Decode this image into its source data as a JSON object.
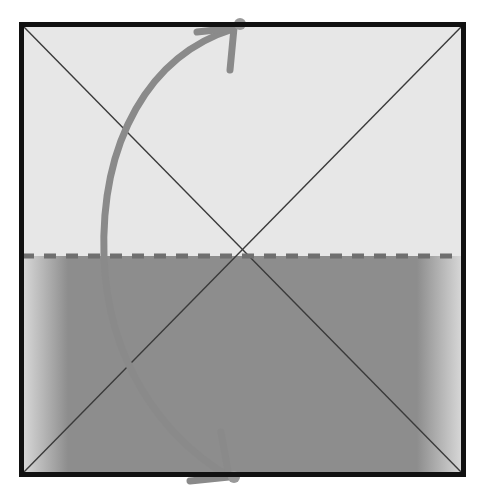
{
  "figure": {
    "title": "",
    "type": "schematic-diagram",
    "canvas": {
      "width": 483,
      "height": 491,
      "background": "#ffffff"
    },
    "frame": {
      "name": "square-frame",
      "x": 19,
      "y": 22,
      "width": 447,
      "height": 455,
      "border_color": "#111111",
      "border_width": 5
    },
    "regions": [
      {
        "name": "upper-light-region",
        "label": "",
        "color": "#e7e7e7",
        "y_top": 22,
        "y_bottom": 256
      },
      {
        "name": "lower-dark-region",
        "label": "",
        "color": "#8d8d8d",
        "y_top": 256,
        "y_bottom": 477,
        "gradient_fade_px": 26
      }
    ],
    "divider": {
      "name": "dashed-interface-line",
      "label": "",
      "y": 256,
      "color": "#6f6f6f",
      "stroke_width": 5,
      "dash": "12 10",
      "x_start": 22,
      "x_end": 464
    },
    "diagonals": [
      {
        "name": "diagonal-tl-br",
        "x1": 22,
        "y1": 25,
        "x2": 463,
        "y2": 474,
        "color": "#3a3a3a",
        "stroke_width": 1.4
      },
      {
        "name": "diagonal-bl-tr",
        "x1": 22,
        "y1": 474,
        "x2": 463,
        "y2": 25,
        "color": "#3a3a3a",
        "stroke_width": 1.4
      }
    ],
    "diagonal_intersection": {
      "x": 242,
      "y": 250
    },
    "arrow": {
      "name": "curved-double-arrow",
      "label": "",
      "color": "#8a8a8a",
      "stroke_width": 7,
      "path": "M 233 29 C 150 55, 100 140, 104 258 C 108 360, 160 435, 228 476",
      "head_top": {
        "x": 233,
        "y": 29,
        "direction": "up-right"
      },
      "head_bottom": {
        "x": 228,
        "y": 476,
        "direction": "down-right"
      },
      "endpoint_markers": [
        {
          "name": "top-endpoint-dot",
          "x": 240,
          "y": 24,
          "r": 6
        },
        {
          "name": "bottom-endpoint-dot",
          "x": 234,
          "y": 477,
          "r": 6
        }
      ]
    }
  },
  "chart_data": {
    "type": "diagram",
    "title": "",
    "xlabel": "",
    "ylabel": "",
    "annotations": [
      "upper light zone",
      "dashed horizontal interface",
      "lower dark zone",
      "two crossing diagonals",
      "curved double-headed arrow spanning top to bottom"
    ]
  }
}
